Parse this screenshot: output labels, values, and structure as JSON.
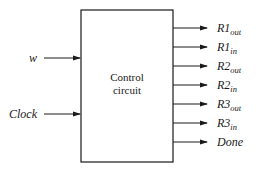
{
  "diagram": {
    "block": {
      "label_line1": "Control",
      "label_line2": "circuit"
    },
    "inputs": [
      {
        "name": "w",
        "y": 58
      },
      {
        "name": "Clock",
        "y": 114
      }
    ],
    "outputs": [
      {
        "base": "R1",
        "sub": "out",
        "y": 28
      },
      {
        "base": "R1",
        "sub": "in",
        "y": 47
      },
      {
        "base": "R2",
        "sub": "out",
        "y": 66
      },
      {
        "base": "R2",
        "sub": "in",
        "y": 85
      },
      {
        "base": "R3",
        "sub": "out",
        "y": 104
      },
      {
        "base": "R3",
        "sub": "in",
        "y": 123
      },
      {
        "base": "Done",
        "sub": "",
        "y": 142
      }
    ],
    "colors": {
      "line": "#1a1a1a",
      "background": "#ffffff"
    }
  }
}
